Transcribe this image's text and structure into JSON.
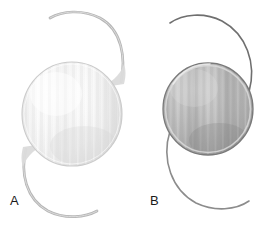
{
  "figure": {
    "background_color": "#ffffff",
    "width": 276,
    "height": 228
  },
  "panels": [
    {
      "id": "A",
      "label": "A",
      "label_x": 10,
      "label_y": 194,
      "description": "Pale translucent silicone intraocular lens with broad plate-style haptic junctions",
      "optic": {
        "name": "lens-optic-a",
        "center_x": 72,
        "center_y": 114,
        "radius_x": 50,
        "radius_y": 52,
        "fill_light": "#fdfdfd",
        "fill_mid": "#eeeeee",
        "fill_dark": "#d6d6d6",
        "edge_color": "#c9c9c9",
        "striation_color": "#e2e2e2",
        "striation_count": 13,
        "opacity": 0.98
      },
      "haptics": [
        {
          "name": "haptic-upper-a",
          "position": "upper",
          "stroke_color": "#b4b4b4",
          "stroke_width": 2.6,
          "path": "M 121 82 C 126 58, 122 30, 100 18 C 82 9, 62 11, 50 18"
        },
        {
          "name": "haptic-lower-a",
          "position": "lower",
          "stroke_color": "#b4b4b4",
          "stroke_width": 2.6,
          "path": "M 26 149 C 20 173, 26 199, 48 211 C 66 220, 86 217, 97 211"
        }
      ],
      "junctions": [
        {
          "name": "junction-upper-a",
          "fill": "#dcdcdc",
          "path": "M 117 86 C 121 80, 123 76, 122 70 C 118 78, 108 84, 99 86 C 106 84, 113 84, 117 86 Z"
        },
        {
          "name": "junction-lower-a",
          "fill": "#dcdcdc",
          "path": "M 30 145 C 26 151, 25 156, 26 162 C 29 153, 38 147, 47 145 C 40 146, 34 146, 30 145 Z"
        }
      ]
    },
    {
      "id": "B",
      "label": "B",
      "label_x": 150,
      "label_y": 194,
      "description": "Darker gray acrylic intraocular lens with thin monofilament loop haptics",
      "optic": {
        "name": "lens-optic-b",
        "center_x": 208,
        "center_y": 109,
        "radius_x": 45,
        "radius_y": 46,
        "fill_light": "#cfcfcf",
        "fill_mid": "#b3b3b3",
        "fill_dark": "#8e8e8e",
        "edge_color": "#7d7d7d",
        "rim_color": "#d9d9d9",
        "striation_color": "#a4a4a4",
        "striation_count": 13,
        "opacity": 1
      },
      "haptics": [
        {
          "name": "haptic-upper-b",
          "position": "upper",
          "stroke_color": "#6e6e6e",
          "stroke_width": 1.5,
          "path": "M 248 91 C 256 63, 246 34, 222 21 C 204 12, 183 14, 170 23"
        },
        {
          "name": "haptic-lower-b",
          "position": "lower",
          "stroke_color": "#8a8a8a",
          "stroke_width": 1.5,
          "path": "M 170 133 C 162 161, 172 190, 196 203 C 214 212, 235 210, 248 201"
        }
      ],
      "junctions": []
    }
  ]
}
